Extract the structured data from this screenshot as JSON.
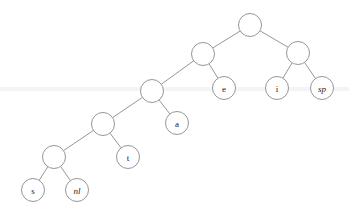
{
  "diagram": {
    "type": "binary-tree",
    "background_color": "#ffffff",
    "stroke_color": "#8a8a8f",
    "label_color": "#1b1b1b",
    "node_radius": 11.5,
    "nodes": [
      {
        "id": "root",
        "label": "",
        "italic": false,
        "x": 250,
        "y": 25,
        "kind": "internal"
      },
      {
        "id": "n1",
        "label": "",
        "italic": false,
        "x": 203,
        "y": 54,
        "kind": "internal"
      },
      {
        "id": "n2",
        "label": "",
        "italic": false,
        "x": 298,
        "y": 53,
        "kind": "internal"
      },
      {
        "id": "leaf-i",
        "label": "i",
        "italic": false,
        "x": 277,
        "y": 88,
        "kind": "leaf"
      },
      {
        "id": "leaf-sp",
        "label": "sp",
        "italic": true,
        "x": 322,
        "y": 88,
        "kind": "leaf"
      },
      {
        "id": "leaf-e",
        "label": "e",
        "italic": false,
        "x": 224,
        "y": 88,
        "kind": "leaf"
      },
      {
        "id": "n3",
        "label": "",
        "italic": false,
        "x": 152,
        "y": 91,
        "kind": "internal"
      },
      {
        "id": "leaf-a",
        "label": "a",
        "italic": false,
        "x": 177,
        "y": 123,
        "kind": "leaf"
      },
      {
        "id": "n4",
        "label": "",
        "italic": false,
        "x": 103,
        "y": 124,
        "kind": "internal"
      },
      {
        "id": "leaf-t",
        "label": "t",
        "italic": false,
        "x": 128,
        "y": 157,
        "kind": "leaf"
      },
      {
        "id": "n5",
        "label": "",
        "italic": false,
        "x": 54,
        "y": 157,
        "kind": "internal"
      },
      {
        "id": "leaf-s",
        "label": "s",
        "italic": false,
        "x": 33,
        "y": 190,
        "kind": "leaf"
      },
      {
        "id": "leaf-nl",
        "label": "nl",
        "italic": true,
        "x": 77,
        "y": 190,
        "kind": "leaf"
      }
    ],
    "edges": [
      {
        "from": "root",
        "to": "n1"
      },
      {
        "from": "root",
        "to": "n2"
      },
      {
        "from": "n2",
        "to": "leaf-i"
      },
      {
        "from": "n2",
        "to": "leaf-sp"
      },
      {
        "from": "n1",
        "to": "n3"
      },
      {
        "from": "n1",
        "to": "leaf-e"
      },
      {
        "from": "n3",
        "to": "n4"
      },
      {
        "from": "n3",
        "to": "leaf-a"
      },
      {
        "from": "n4",
        "to": "n5"
      },
      {
        "from": "n4",
        "to": "leaf-t"
      },
      {
        "from": "n5",
        "to": "leaf-s"
      },
      {
        "from": "n5",
        "to": "leaf-nl"
      }
    ],
    "scan_band": {
      "y": 87,
      "color": "#f4f4f6"
    }
  }
}
